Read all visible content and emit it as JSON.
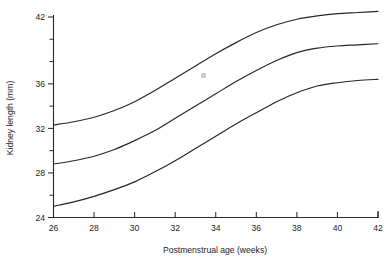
{
  "chart_data": {
    "type": "line",
    "title": "",
    "xlabel": "Postmenstrual age (weeks)",
    "ylabel": "Kidney length (mm)",
    "xlim": [
      26,
      42
    ],
    "ylim": [
      24,
      42.8
    ],
    "grid": false,
    "legend": "none",
    "xticks": [
      26,
      28,
      30,
      32,
      34,
      36,
      38,
      40,
      42
    ],
    "xtick_labels": [
      "26",
      "28",
      "30",
      "32",
      "34",
      "36",
      "38",
      "40",
      "42"
    ],
    "xtick_minor": [
      27,
      29,
      31,
      33,
      35,
      37,
      39,
      41
    ],
    "yticks": [
      24,
      28,
      32,
      36,
      42
    ],
    "ytick_labels": [
      "24",
      "28",
      "32",
      "36",
      "42"
    ],
    "ytick_minor": [
      26,
      30,
      34,
      38,
      40
    ],
    "x": [
      26,
      27,
      28,
      29,
      30,
      31,
      32,
      33,
      34,
      35,
      36,
      37,
      38,
      39,
      40,
      41,
      42
    ],
    "series": [
      {
        "name": "upper",
        "values": [
          32.3,
          32.6,
          33.0,
          33.6,
          34.4,
          35.4,
          36.5,
          37.6,
          38.7,
          39.7,
          40.6,
          41.3,
          41.8,
          42.1,
          42.3,
          42.4,
          42.5
        ]
      },
      {
        "name": "median",
        "values": [
          28.8,
          29.1,
          29.5,
          30.1,
          30.9,
          31.8,
          32.9,
          34.0,
          35.1,
          36.2,
          37.2,
          38.1,
          38.8,
          39.2,
          39.4,
          39.5,
          39.6
        ]
      },
      {
        "name": "lower",
        "values": [
          25.0,
          25.4,
          25.9,
          26.5,
          27.2,
          28.1,
          29.1,
          30.2,
          31.3,
          32.4,
          33.4,
          34.4,
          35.2,
          35.8,
          36.1,
          36.3,
          36.4
        ]
      }
    ]
  },
  "marks": {
    "artifact_label": ""
  }
}
